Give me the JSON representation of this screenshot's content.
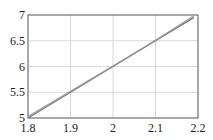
{
  "chart_data": {
    "type": "line",
    "title": "",
    "xlabel": "",
    "ylabel": "",
    "xlim": [
      1.8,
      2.2
    ],
    "ylim": [
      5,
      7
    ],
    "grid": true,
    "legend": null,
    "x_ticks": [
      "1.8",
      "1.9",
      "2",
      "2.1",
      "2.2"
    ],
    "y_ticks": [
      "5",
      "5.5",
      "6",
      "6.5",
      "7"
    ],
    "series": [
      {
        "name": "line-1",
        "x": [
          1.8,
          1.9,
          2.0,
          2.1,
          2.19
        ],
        "y": [
          5.0,
          5.5,
          6.0,
          6.5,
          6.95
        ],
        "color": "#777777"
      },
      {
        "name": "line-2",
        "x": [
          1.8,
          1.9,
          2.0,
          2.1,
          2.19
        ],
        "y": [
          5.03,
          5.52,
          6.01,
          6.51,
          6.98
        ],
        "color": "#999999"
      }
    ]
  },
  "colors": {
    "grid": "#d9d9d9",
    "frame": "#555555",
    "text": "#222222"
  }
}
